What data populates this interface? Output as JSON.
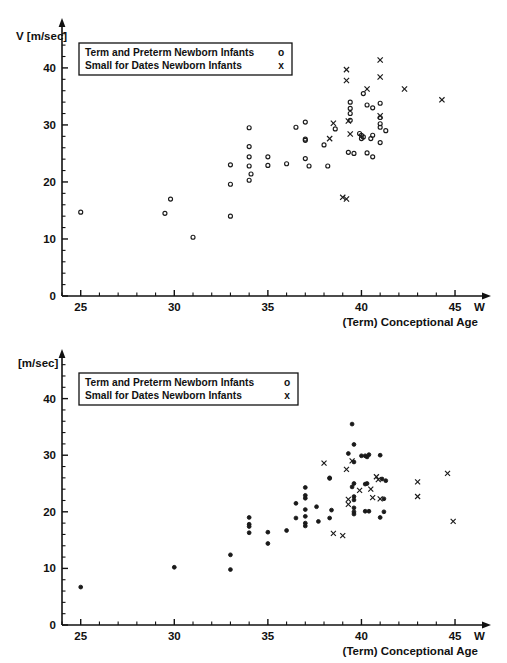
{
  "figure": {
    "background_color": "#ffffff",
    "ink_color": "#111111"
  },
  "legend": {
    "rows": [
      {
        "label": "Term and Preterm Newborn Infants",
        "symbol": "o",
        "marker": "circle"
      },
      {
        "label": "Small for Dates Newborn Infants",
        "symbol": "x",
        "marker": "cross"
      }
    ]
  },
  "axes": {
    "y_label_top": "V [m/sec]",
    "y_label_bottom": "[m/sec]",
    "x_label": "(Term) Conceptional Age",
    "x_unit_suffix": "W",
    "y_ticks": [
      "0",
      "10",
      "20",
      "30",
      "40"
    ],
    "x_ticks": [
      "25",
      "30",
      "35",
      "40",
      "45"
    ]
  },
  "chart_data": [
    {
      "id": "top-panel",
      "type": "scatter",
      "title": "",
      "xlabel": "(Term) Conceptional Age",
      "ylabel": "V [m/sec]",
      "xlim": [
        24,
        45.8
      ],
      "ylim": [
        0,
        47
      ],
      "xticks": [
        25,
        30,
        35,
        40,
        45
      ],
      "yticks": [
        0,
        10,
        20,
        30,
        40
      ],
      "x_minor_step": 1,
      "y_minor_step": 2,
      "grid": false,
      "legend_position": "upper-left",
      "series": [
        {
          "name": "Term and Preterm Newborn Infants",
          "marker": "o",
          "points": [
            [
              25.0,
              14.7
            ],
            [
              29.5,
              14.5
            ],
            [
              29.8,
              17.0
            ],
            [
              31.0,
              10.3
            ],
            [
              33.0,
              23.0
            ],
            [
              33.0,
              19.6
            ],
            [
              33.0,
              14.0
            ],
            [
              34.0,
              29.5
            ],
            [
              34.0,
              26.2
            ],
            [
              34.0,
              24.4
            ],
            [
              34.0,
              22.8
            ],
            [
              34.1,
              21.4
            ],
            [
              34.0,
              20.3
            ],
            [
              35.0,
              24.4
            ],
            [
              35.0,
              22.9
            ],
            [
              36.0,
              23.2
            ],
            [
              36.5,
              29.6
            ],
            [
              37.0,
              30.5
            ],
            [
              37.0,
              27.5
            ],
            [
              37.0,
              27.3
            ],
            [
              37.0,
              24.1
            ],
            [
              37.2,
              22.8
            ],
            [
              38.0,
              26.5
            ],
            [
              38.2,
              22.8
            ],
            [
              38.6,
              29.3
            ],
            [
              39.4,
              34.0
            ],
            [
              39.4,
              32.9
            ],
            [
              39.4,
              32.0
            ],
            [
              39.4,
              30.8
            ],
            [
              39.3,
              25.2
            ],
            [
              39.6,
              25.0
            ],
            [
              39.9,
              28.5
            ],
            [
              40.0,
              28.2
            ],
            [
              40.0,
              27.6
            ],
            [
              40.1,
              27.9
            ],
            [
              40.1,
              35.5
            ],
            [
              40.3,
              33.5
            ],
            [
              40.3,
              25.1
            ],
            [
              40.6,
              33.0
            ],
            [
              40.6,
              28.2
            ],
            [
              40.5,
              27.6
            ],
            [
              40.6,
              24.4
            ],
            [
              41.0,
              33.8
            ],
            [
              41.0,
              31.3
            ],
            [
              41.0,
              30.2
            ],
            [
              41.0,
              29.6
            ],
            [
              41.0,
              26.9
            ],
            [
              41.3,
              29.0
            ]
          ]
        },
        {
          "name": "Small for Dates Newborn Infants",
          "marker": "x",
          "points": [
            [
              38.5,
              30.3
            ],
            [
              38.3,
              27.6
            ],
            [
              39.2,
              39.7
            ],
            [
              39.2,
              37.8
            ],
            [
              39.3,
              30.7
            ],
            [
              39.4,
              28.4
            ],
            [
              39.0,
              17.3
            ],
            [
              39.2,
              17.0
            ],
            [
              40.3,
              36.3
            ],
            [
              41.0,
              41.4
            ],
            [
              41.0,
              38.4
            ],
            [
              41.0,
              31.6
            ],
            [
              42.3,
              36.3
            ],
            [
              44.3,
              34.4
            ]
          ]
        }
      ]
    },
    {
      "id": "bottom-panel",
      "type": "scatter",
      "title": "",
      "xlabel": "(Term) Conceptional Age",
      "ylabel": "[m/sec]",
      "xlim": [
        24,
        45.8
      ],
      "ylim": [
        0,
        47
      ],
      "xticks": [
        25,
        30,
        35,
        40,
        45
      ],
      "yticks": [
        0,
        10,
        20,
        30,
        40
      ],
      "x_minor_step": 1,
      "y_minor_step": 2,
      "grid": false,
      "legend_position": "upper-left",
      "series": [
        {
          "name": "Term and Preterm Newborn Infants",
          "marker": "o",
          "points": [
            [
              25.0,
              6.7
            ],
            [
              30.0,
              10.2
            ],
            [
              33.0,
              12.4
            ],
            [
              33.0,
              9.8
            ],
            [
              34.0,
              19.0
            ],
            [
              34.0,
              17.8
            ],
            [
              34.0,
              17.4
            ],
            [
              34.0,
              16.3
            ],
            [
              35.0,
              16.4
            ],
            [
              35.0,
              14.4
            ],
            [
              36.0,
              16.7
            ],
            [
              36.5,
              21.5
            ],
            [
              36.5,
              18.9
            ],
            [
              37.0,
              24.3
            ],
            [
              37.0,
              22.9
            ],
            [
              37.0,
              22.4
            ],
            [
              37.0,
              20.4
            ],
            [
              37.0,
              19.2
            ],
            [
              37.0,
              18.0
            ],
            [
              37.0,
              17.5
            ],
            [
              37.6,
              20.9
            ],
            [
              37.7,
              18.3
            ],
            [
              38.3,
              26.0
            ],
            [
              38.3,
              25.9
            ],
            [
              38.4,
              20.3
            ],
            [
              38.3,
              18.9
            ],
            [
              39.3,
              30.3
            ],
            [
              39.5,
              35.5
            ],
            [
              39.6,
              31.9
            ],
            [
              39.6,
              28.8
            ],
            [
              39.5,
              24.4
            ],
            [
              39.6,
              25.0
            ],
            [
              39.6,
              22.7
            ],
            [
              39.6,
              22.1
            ],
            [
              39.6,
              20.7
            ],
            [
              39.6,
              20.0
            ],
            [
              39.6,
              19.6
            ],
            [
              40.0,
              29.9
            ],
            [
              40.2,
              29.9
            ],
            [
              40.4,
              30.1
            ],
            [
              40.3,
              29.7
            ],
            [
              40.2,
              24.9
            ],
            [
              40.3,
              25.0
            ],
            [
              40.2,
              20.1
            ],
            [
              40.4,
              20.1
            ],
            [
              41.0,
              30.0
            ],
            [
              41.1,
              25.8
            ],
            [
              41.3,
              25.5
            ],
            [
              41.2,
              22.3
            ],
            [
              41.2,
              20.0
            ],
            [
              41.0,
              19.0
            ]
          ]
        },
        {
          "name": "Small for Dates Newborn Infants",
          "marker": "x",
          "points": [
            [
              38.0,
              28.6
            ],
            [
              38.5,
              16.2
            ],
            [
              39.0,
              15.8
            ],
            [
              39.2,
              27.5
            ],
            [
              39.5,
              29.0
            ],
            [
              39.3,
              22.2
            ],
            [
              39.3,
              21.3
            ],
            [
              39.9,
              23.8
            ],
            [
              40.5,
              24.0
            ],
            [
              40.6,
              22.5
            ],
            [
              40.8,
              26.2
            ],
            [
              40.9,
              25.7
            ],
            [
              41.0,
              22.3
            ],
            [
              43.0,
              25.3
            ],
            [
              43.0,
              22.7
            ],
            [
              44.6,
              26.8
            ],
            [
              44.9,
              18.3
            ]
          ]
        }
      ]
    }
  ]
}
